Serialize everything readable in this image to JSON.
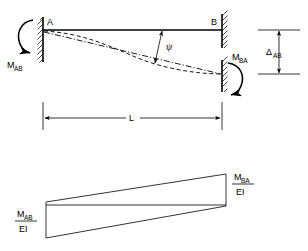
{
  "figure": {
    "upper_diagram": {
      "name": "fixed-fixed-beam-with-support-settlement",
      "joint_a_label": "A",
      "joint_b_label": "B",
      "moment_a_label": "M",
      "moment_a_subscript": "AB",
      "moment_b_label": "M",
      "moment_b_subscript": "BA",
      "rotation_angle_label": "ψ",
      "span_label": "L",
      "settlement_label": "Δ",
      "settlement_subscript": "AB"
    },
    "lower_diagram": {
      "name": "m-over-ei-moment-diagram",
      "left_value_numerator": "M",
      "left_value_subscript": "AB",
      "left_value_denominator": "EI",
      "right_value_numerator": "M",
      "right_value_subscript": "BA",
      "right_value_denominator": "EI"
    },
    "colors": {
      "line": "#000000",
      "background": "#ffffff"
    }
  }
}
